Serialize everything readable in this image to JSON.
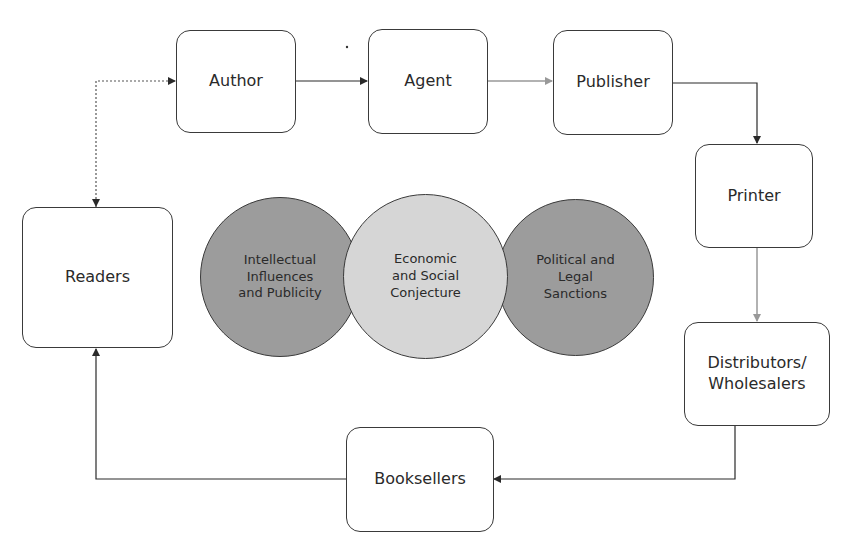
{
  "nodes": {
    "author": "Author",
    "agent": "Agent",
    "publisher": "Publisher",
    "printer": "Printer",
    "distributors": "Distributors/\nWholesalers",
    "booksellers": "Booksellers",
    "readers": "Readers"
  },
  "circles": {
    "left": "Intellectual\nInfluences\nand Publicity",
    "center": "Economic\nand Social\nConjecture",
    "right": "Political and\nLegal\nSanctions"
  },
  "colors": {
    "dark_circle": "#9c9c9c",
    "light_circle": "#d6d6d6",
    "arrow_dark": "#2a2a2a",
    "arrow_light": "#999999"
  }
}
